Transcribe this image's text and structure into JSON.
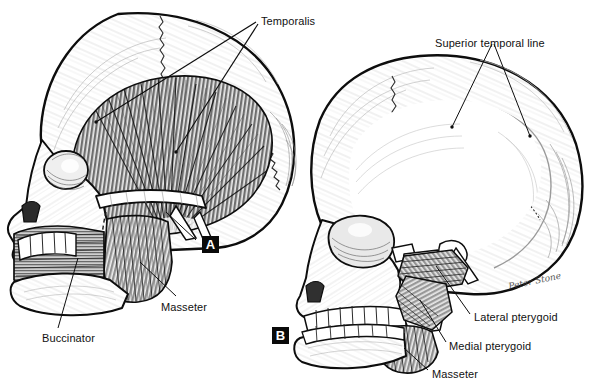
{
  "figure": {
    "type": "anatomical-illustration",
    "background_color": "#ffffff",
    "ink_color": "#000000",
    "panels": [
      {
        "id": "A",
        "badge": "A",
        "badge_x": 202,
        "badge_y": 236,
        "description": "Left lateral skull with temporalis, masseter and buccinator shown"
      },
      {
        "id": "B",
        "badge": "B",
        "badge_x": 272,
        "badge_y": 327,
        "description": "Left lateral skull with zygomatic arch removed showing pterygoids"
      }
    ],
    "labels": [
      {
        "name": "temporalis",
        "text": "Temporalis",
        "x": 261,
        "y": 16,
        "leaders": 2
      },
      {
        "name": "superior-temporal-line",
        "text": "Superior temporal line",
        "x": 435,
        "y": 38,
        "leaders": 2
      },
      {
        "name": "masseter-a",
        "text": "Masseter",
        "x": 161,
        "y": 302,
        "leaders": 1
      },
      {
        "name": "buccinator",
        "text": "Buccinator",
        "x": 42,
        "y": 333,
        "leaders": 1
      },
      {
        "name": "lateral-pterygoid",
        "text": "Lateral pterygoid",
        "x": 474,
        "y": 312,
        "leaders": 1
      },
      {
        "name": "medial-pterygoid",
        "text": "Medial pterygoid",
        "x": 449,
        "y": 341,
        "leaders": 1
      },
      {
        "name": "masseter-b",
        "text": "Masseter",
        "x": 432,
        "y": 369,
        "leaders": 1
      }
    ],
    "signature": {
      "text": "Peter Stone",
      "x": 508,
      "y": 276
    }
  }
}
